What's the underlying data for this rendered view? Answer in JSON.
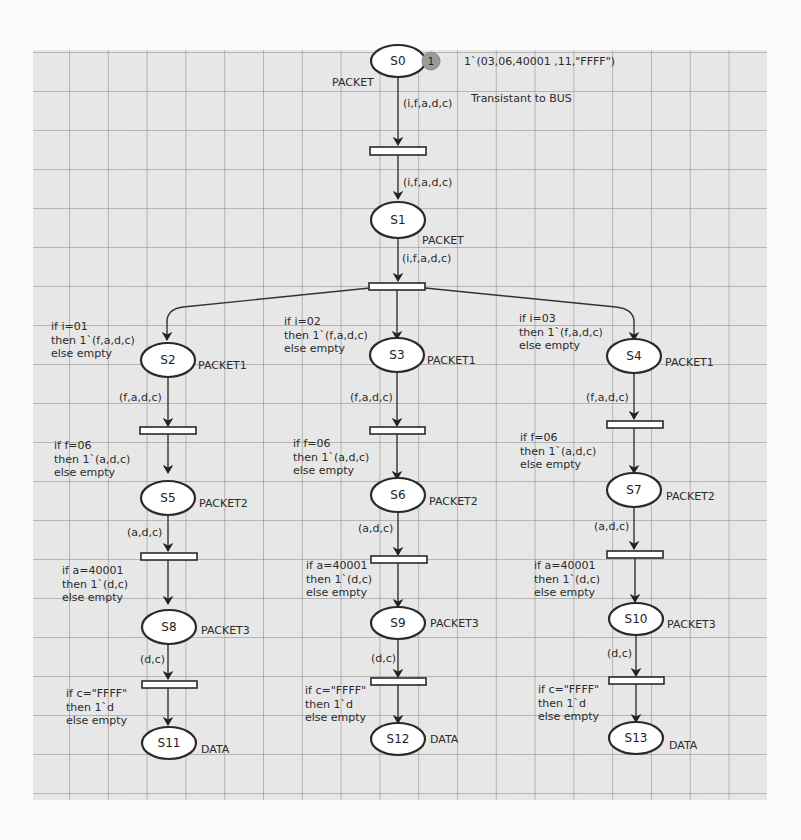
{
  "diagram": {
    "type": "colored-petri-net",
    "places": [
      {
        "id": "S0",
        "label": "S0",
        "type": "PACKET"
      },
      {
        "id": "S1",
        "label": "S1",
        "type": "PACKET"
      },
      {
        "id": "S2",
        "label": "S2",
        "type": "PACKET1"
      },
      {
        "id": "S3",
        "label": "S3",
        "type": "PACKET1"
      },
      {
        "id": "S4",
        "label": "S4",
        "type": "PACKET1"
      },
      {
        "id": "S5",
        "label": "S5",
        "type": "PACKET2"
      },
      {
        "id": "S6",
        "label": "S6",
        "type": "PACKET2"
      },
      {
        "id": "S7",
        "label": "S7",
        "type": "PACKET2"
      },
      {
        "id": "S8",
        "label": "S8",
        "type": "PACKET3"
      },
      {
        "id": "S9",
        "label": "S9",
        "type": "PACKET3"
      },
      {
        "id": "S10",
        "label": "S10",
        "type": "PACKET3"
      },
      {
        "id": "S11",
        "label": "S11",
        "type": "DATA"
      },
      {
        "id": "S12",
        "label": "S12",
        "type": "DATA"
      },
      {
        "id": "S13",
        "label": "S13",
        "type": "DATA"
      }
    ],
    "initial_marking": {
      "place": "S0",
      "token_count": "1",
      "value": "1`(03,06,40001 ,11,\"FFFF\")"
    },
    "transition_annotation": "Transistant to BUS",
    "arc_inscriptions": {
      "s0_out": "(i,f,a,d,c)",
      "s1_in": "(i,f,a,d,c)",
      "s1_out": "(i,f,a,d,c)",
      "s2_out": "(f,a,d,c)",
      "s3_out": "(f,a,d,c)",
      "s4_out": "(f,a,d,c)",
      "s5_out": "(a,d,c)",
      "s6_out": "(a,d,c)",
      "s7_out": "(a,d,c)",
      "s8_out": "(d,c)",
      "s9_out": "(d,c)",
      "s10_out": "(d,c)"
    },
    "guards": {
      "to_s2": [
        "if i=01",
        "then 1`(f,a,d,c)",
        "else empty"
      ],
      "to_s3": [
        "if i=02",
        "then 1`(f,a,d,c)",
        "else empty"
      ],
      "to_s4": [
        "if i=03",
        "then 1`(f,a,d,c)",
        "else empty"
      ],
      "to_s5": [
        "if f=06",
        "then 1`(a,d,c)",
        "else empty"
      ],
      "to_s6": [
        "if f=06",
        "then 1`(a,d,c)",
        "else empty"
      ],
      "to_s7": [
        "if f=06",
        "then 1`(a,d,c)",
        "else empty"
      ],
      "to_s8": [
        "if  a=40001",
        "then 1`(d,c)",
        "else empty"
      ],
      "to_s9": [
        "if a=40001",
        "then 1`(d,c)",
        "else empty"
      ],
      "to_s10": [
        "if a=40001",
        "then 1`(d,c)",
        "else empty"
      ],
      "to_s11": [
        "if c=\"FFFF\"",
        "then 1`d",
        "else empty"
      ],
      "to_s12": [
        "if c=\"FFFF\"",
        "then 1`d",
        "else empty"
      ],
      "to_s13": [
        "if c=\"FFFF\"",
        "then 1`d",
        "else empty"
      ]
    }
  },
  "colors": {
    "canvas": "#e7e7e7",
    "grid": "#8a8a8a",
    "stroke": "#2a2a2a",
    "token": "#9a9a9a"
  }
}
